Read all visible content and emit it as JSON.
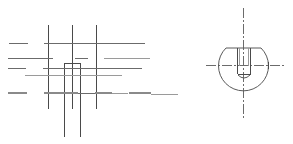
{
  "drawing": {
    "type": "engineering-drawing",
    "line_color": "#6b6b6b",
    "background": "#ffffff",
    "views": [
      {
        "name": "front-view",
        "description": "Grid of horizontal and vertical lines with a narrow rectangular slot",
        "vertical_lines_x": [
          48,
          72,
          96
        ],
        "slot": {
          "x": 64,
          "y": 63,
          "w": 16,
          "h": 74
        }
      },
      {
        "name": "side-view",
        "description": "Truncated circle with threaded hole and crossed center lines",
        "center": {
          "x": 243,
          "y": 65
        },
        "radius": 25
      }
    ]
  }
}
